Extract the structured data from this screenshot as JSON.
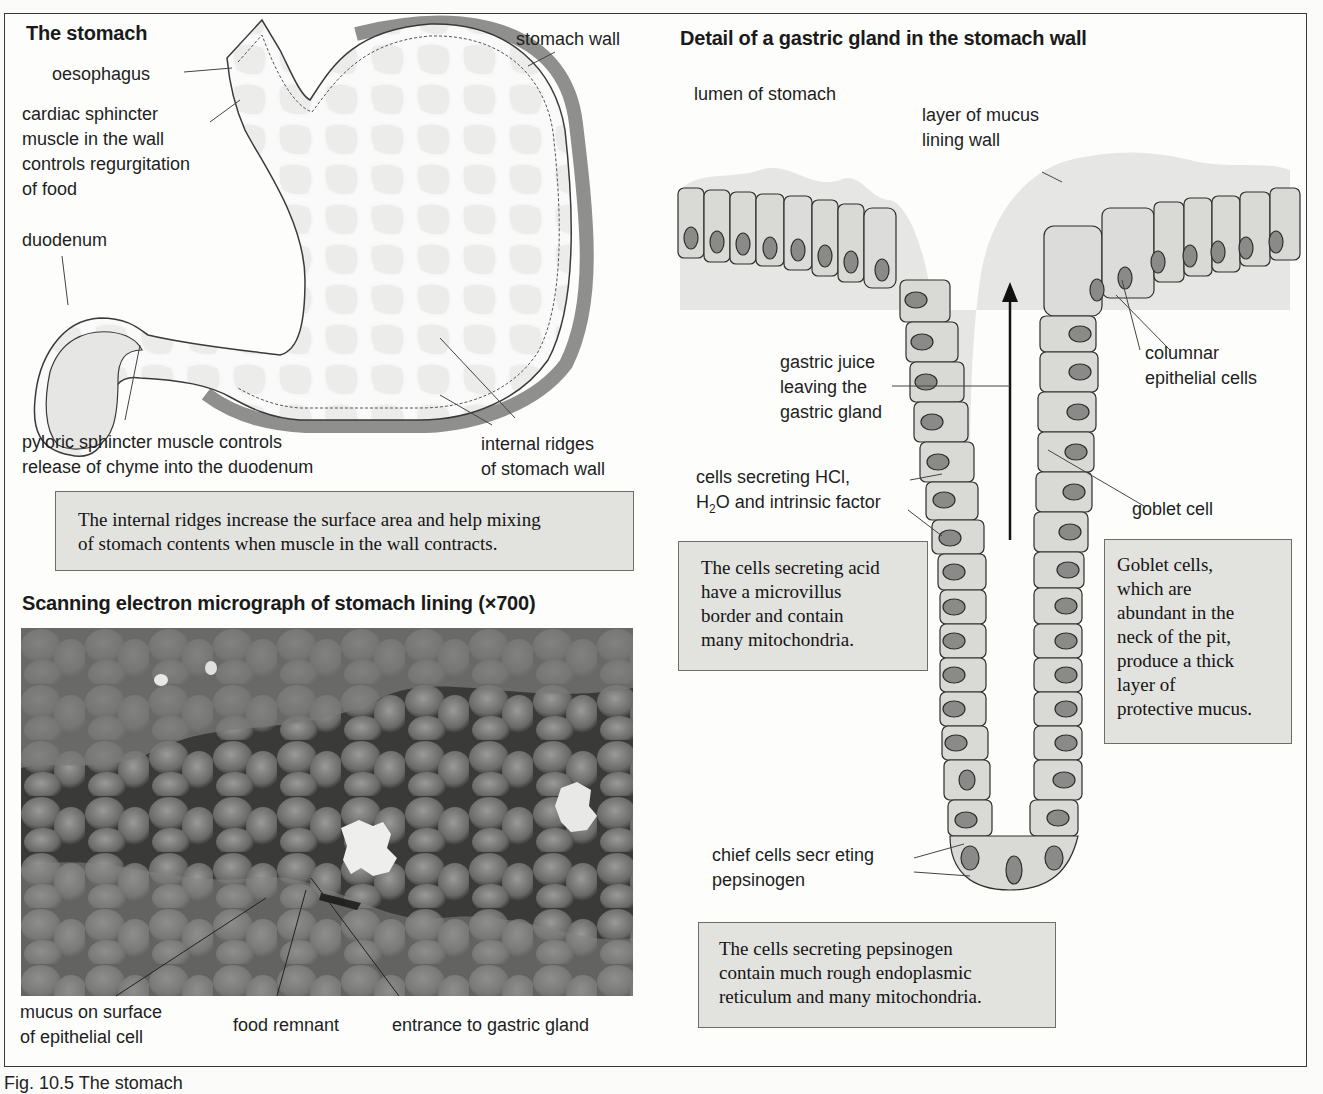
{
  "stomach_panel": {
    "title": "The stomach",
    "labels": {
      "oesophagus": "oesophagus",
      "cardiac_1": "cardiac sphincter",
      "cardiac_2": "muscle in the wall",
      "cardiac_3": "controls regurgitation",
      "cardiac_4": "of food",
      "duodenum": "duodenum",
      "stomach_wall": "stomach wall",
      "pyloric_1": "pyloric sphincter muscle controls",
      "pyloric_2": "release of chyme into the duodenum",
      "ridges_1": "internal ridges",
      "ridges_2": "of stomach wall"
    },
    "note": {
      "line1": "The internal ridges increase the surface area and help mixing",
      "line2": "of stomach contents when muscle in the wall contracts."
    }
  },
  "micrograph_panel": {
    "title": "Scanning electron micrograph of stomach lining (×700)",
    "labels": {
      "mucus_1": "mucus on surface",
      "mucus_2": "of epithelial cell",
      "food": "food remnant",
      "entrance": "entrance to gastric gland"
    }
  },
  "gland_panel": {
    "title": "Detail of a gastric gland in the stomach wall",
    "labels": {
      "lumen": "lumen of stomach",
      "mucus_layer_1": "layer of mucus",
      "mucus_layer_2": "lining wall",
      "juice_1": "gastric juice",
      "juice_2": "leaving the",
      "juice_3": "gastric gland",
      "columnar_1": "columnar",
      "columnar_2": "epithelial cells",
      "hcl_1": "cells secreting HCl,",
      "hcl_2_pre": "H",
      "hcl_2_sub": "2",
      "hcl_2_post": "O and intrinsic factor",
      "goblet": "goblet cell",
      "chief_1": "chief cells secr eting",
      "chief_2": "pepsinogen"
    },
    "notes": {
      "acid": [
        "The cells secreting acid",
        "have a microvillus",
        "border and contain",
        "many mitochondria."
      ],
      "goblet": [
        "Goblet cells,",
        "which are",
        "abundant in the",
        "neck of the pit,",
        "produce a thick",
        "layer of",
        "protective mucus."
      ],
      "pepsinogen": [
        "The cells secreting pepsinogen",
        "contain much rough endoplasmic",
        "reticulum and many mitochondria."
      ]
    }
  },
  "figure_caption": "Fig. 10.5  The stomach",
  "colors": {
    "cell_fill": "#d9d9d6",
    "nucleus_fill": "#8a8a88",
    "mucus_fill": "#e3e3e1",
    "note_box": "#e2e2df",
    "wall_shade": "#8f8f8d"
  }
}
